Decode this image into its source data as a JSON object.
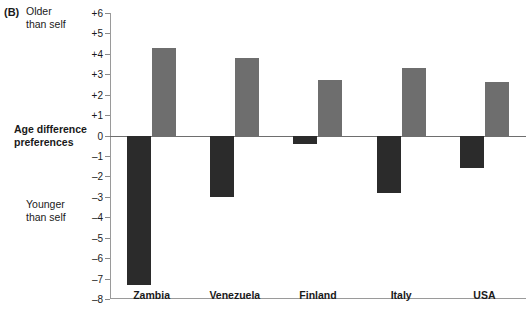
{
  "figure": {
    "panel_letter": "(B)",
    "top_annotation": "Older\nthan self",
    "bottom_annotation": "Younger\nthan self",
    "axis_title": "Age difference\npreferences"
  },
  "colors": {
    "negative_bar": "#2b2b2b",
    "positive_bar": "#6e6e6e",
    "axis": "#8a8a8a",
    "text": "#1a1a1a"
  },
  "chart_data": {
    "type": "bar",
    "title": "",
    "xlabel": "",
    "ylabel": "Age difference preferences",
    "ylim": [
      -8,
      6
    ],
    "yticks": [
      "+6",
      "+5",
      "+4",
      "+3",
      "+2",
      "+1",
      "0",
      "–1",
      "–2",
      "–3",
      "–4",
      "–5",
      "–6",
      "–7",
      "–8"
    ],
    "ytick_values": [
      6,
      5,
      4,
      3,
      2,
      1,
      0,
      -1,
      -2,
      -3,
      -4,
      -5,
      -6,
      -7,
      -8
    ],
    "grid": false,
    "legend": "none",
    "categories": [
      "Zambia",
      "Venezuela",
      "Finland",
      "Italy",
      "USA"
    ],
    "series": [
      {
        "name": "Younger than self",
        "color": "#2b2b2b",
        "values": [
          -7.3,
          -3.0,
          -0.4,
          -2.8,
          -1.6
        ]
      },
      {
        "name": "Older than self",
        "color": "#6e6e6e",
        "values": [
          4.3,
          3.8,
          2.7,
          3.3,
          2.6
        ]
      }
    ]
  }
}
